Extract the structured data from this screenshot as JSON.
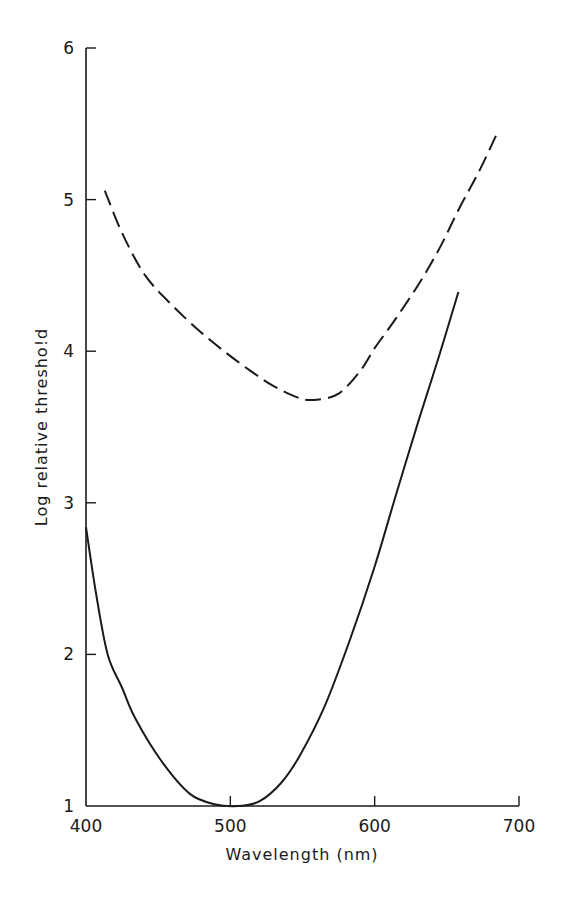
{
  "chart_data": {
    "type": "line",
    "title": "",
    "xlabel": "Wavelength (nm)",
    "ylabel": "Log relative thresho!d",
    "xlim": [
      400,
      700
    ],
    "ylim": [
      1,
      6
    ],
    "xticks": [
      400,
      500,
      600,
      700
    ],
    "yticks": [
      1,
      2,
      3,
      4,
      5,
      6
    ],
    "grid": false,
    "legend": "none",
    "series": [
      {
        "name": "solid curve",
        "style": "solid",
        "x": [
          400,
          407,
          415,
          425,
          434,
          452,
          472,
          490,
          505,
          520,
          535,
          548,
          565,
          583,
          600,
          615,
          631,
          645,
          658
        ],
        "y": [
          2.84,
          2.4,
          2.0,
          1.78,
          1.58,
          1.3,
          1.08,
          1.01,
          1.0,
          1.03,
          1.15,
          1.33,
          1.65,
          2.1,
          2.58,
          3.06,
          3.56,
          3.98,
          4.39
        ]
      },
      {
        "name": "dashed curve",
        "style": "dashed",
        "x": [
          413,
          425,
          441,
          460,
          479,
          497,
          514,
          530,
          548,
          560,
          575,
          590,
          600,
          615,
          631,
          645,
          659,
          672,
          684
        ],
        "y": [
          5.06,
          4.78,
          4.5,
          4.3,
          4.13,
          3.99,
          3.87,
          3.77,
          3.69,
          3.68,
          3.72,
          3.87,
          4.02,
          4.22,
          4.45,
          4.68,
          4.95,
          5.18,
          5.42
        ]
      }
    ]
  },
  "axes": {
    "x_title": "Wavelength (nm)",
    "y_title": "Log relative thresho!d",
    "x_tick_labels": [
      "400",
      "500",
      "600",
      "700"
    ],
    "y_tick_labels": [
      "1",
      "2",
      "3",
      "4",
      "5",
      "6"
    ]
  }
}
